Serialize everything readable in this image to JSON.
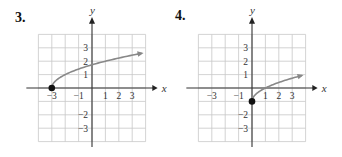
{
  "chart_data": [
    {
      "type": "line",
      "label": "3.",
      "xlabel": "x",
      "ylabel": "y",
      "xlim": [
        -4,
        4
      ],
      "ylim": [
        -4,
        4
      ],
      "grid": true,
      "x_ticks": [
        "-3",
        "-1",
        "1",
        "2",
        "3"
      ],
      "y_ticks": [
        "3",
        "2",
        "1",
        "-2",
        "-3"
      ],
      "function": "y = sqrt(x + 3)",
      "start_point": [
        -3,
        0
      ],
      "start_point_filled": true,
      "end_arrow": true,
      "points": [
        [
          -3,
          0
        ],
        [
          -2,
          1
        ],
        [
          -1,
          1.41
        ],
        [
          0,
          1.73
        ],
        [
          1,
          2
        ],
        [
          2,
          2.24
        ],
        [
          3,
          2.45
        ],
        [
          3.7,
          2.59
        ]
      ],
      "curve_color": "#888888"
    },
    {
      "type": "line",
      "label": "4.",
      "xlabel": "x",
      "ylabel": "y",
      "xlim": [
        -4,
        4
      ],
      "ylim": [
        -4,
        4
      ],
      "grid": true,
      "x_ticks": [
        "-3",
        "-1",
        "1",
        "2",
        "3"
      ],
      "y_ticks": [
        "3",
        "2",
        "1",
        "-2",
        "-3"
      ],
      "function": "y = sqrt(x) - 1",
      "start_point": [
        0,
        -1
      ],
      "start_point_filled": true,
      "end_arrow": true,
      "points": [
        [
          0,
          -1
        ],
        [
          0.25,
          -0.5
        ],
        [
          1,
          0
        ],
        [
          2,
          0.41
        ],
        [
          3,
          0.73
        ],
        [
          3.7,
          0.92
        ]
      ],
      "curve_color": "#888888"
    }
  ]
}
